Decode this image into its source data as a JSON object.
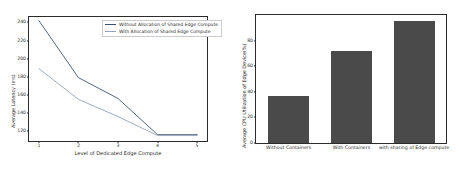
{
  "chart_data": [
    {
      "type": "line",
      "title": "",
      "xlabel": "Level of Dedicated Edge Compute",
      "ylabel": "Average Latency (ms)",
      "x": [
        1,
        2,
        3,
        4,
        5
      ],
      "xticks": [
        "1",
        "2",
        "3",
        "4",
        "5"
      ],
      "yticks": [
        "120",
        "140",
        "160",
        "180",
        "200",
        "220",
        "240"
      ],
      "ylim": [
        113,
        250
      ],
      "xlim": [
        0.75,
        5.25
      ],
      "grid": false,
      "legend_position": "upper right",
      "series": [
        {
          "name": "Without Allocation of Shared Edge Compute",
          "values": [
            246,
            183,
            160,
            120,
            120
          ],
          "color": "#3b5070"
        },
        {
          "name": "With Allocation of Shared Edge Compute",
          "values": [
            193,
            159,
            140,
            119,
            119
          ],
          "color": "#93a3b5"
        }
      ]
    },
    {
      "type": "bar",
      "title": "",
      "xlabel": "",
      "ylabel": "Average CPU Utilization of Edge Device(%)",
      "categories": [
        "Without Containers",
        "With Containers",
        "with sharing of Edge compute"
      ],
      "values": [
        37,
        72,
        95
      ],
      "yticks": [
        "0",
        "20",
        "40",
        "60",
        "80"
      ],
      "ylim": [
        0,
        100
      ],
      "grid": false,
      "bar_color": "#4a4a4a"
    }
  ],
  "figure": {
    "background": "#ffffff",
    "axis_color": "#2b2b2b"
  }
}
